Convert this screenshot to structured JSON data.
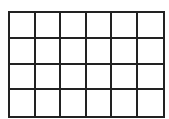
{
  "grid": {
    "rows": 4,
    "columns": 6,
    "line_color": "#222222",
    "fill_color": "#ffffff",
    "cells": [
      [
        "",
        "",
        "",
        "",
        "",
        ""
      ],
      [
        "",
        "",
        "",
        "",
        "",
        ""
      ],
      [
        "",
        "",
        "",
        "",
        "",
        ""
      ],
      [
        "",
        "",
        "",
        "",
        "",
        ""
      ]
    ]
  }
}
